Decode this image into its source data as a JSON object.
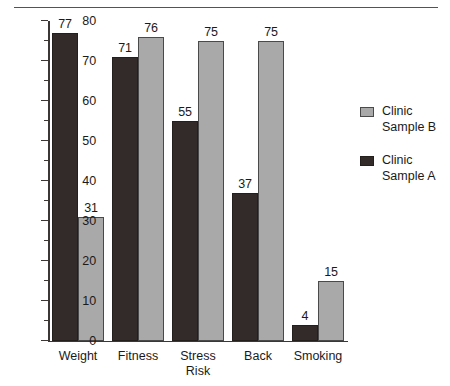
{
  "chart_data": {
    "type": "bar",
    "title": "",
    "subtitle": "",
    "xlabel": "",
    "ylabel": "",
    "ylim": [
      0,
      80
    ],
    "ytick_step": 10,
    "yminor_step": 5,
    "yticks": [
      0,
      10,
      20,
      30,
      40,
      50,
      60,
      70,
      80
    ],
    "ytick_labels": [
      "0",
      "10",
      "20",
      "30",
      "40",
      "50",
      "60",
      "70",
      "80"
    ],
    "grid": false,
    "legend_position": "right",
    "categories": [
      "Weight",
      "Fitness",
      "Stress\nRisk",
      "Back",
      "Smoking"
    ],
    "series": [
      {
        "name": "Clinic Sample A",
        "color": "#332b29",
        "values": [
          77,
          71,
          55,
          37,
          4
        ],
        "value_labels": [
          "77",
          "71",
          "55",
          "37",
          "4"
        ]
      },
      {
        "name": "Clinic Sample B",
        "color": "#a9a9a9",
        "values": [
          31,
          76,
          75,
          75,
          15
        ],
        "value_labels": [
          "31",
          "76",
          "75",
          "75",
          "15"
        ]
      }
    ]
  },
  "legend": {
    "entries": [
      {
        "label": "Clinic\nSample B",
        "swatch": "light"
      },
      {
        "label": "Clinic\nSample A",
        "swatch": "dark"
      }
    ]
  },
  "colors": {
    "sample_a": "#332b29",
    "sample_b": "#a9a9a9",
    "axis": "#3a3734",
    "rule": "#55524f",
    "background": "#ffffff",
    "text": "#1c1a19"
  }
}
